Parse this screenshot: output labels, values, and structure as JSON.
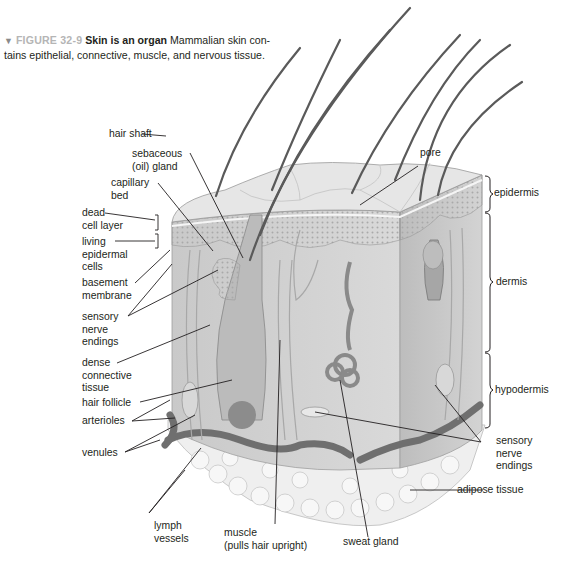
{
  "caption": {
    "figure_number": "FIGURE 32-9",
    "title": "Skin is an organ",
    "body_line1": "Mammalian skin con-",
    "body_line2": "tains epithelial, connective, muscle, and nervous tissue."
  },
  "labels_left": {
    "hair_shaft": "hair shaft",
    "sebaceous_1": "sebaceous",
    "sebaceous_2": "(oil) gland",
    "capillary_1": "capillary",
    "capillary_2": "bed",
    "dead_1": "dead",
    "dead_2": "cell layer",
    "living_1": "living",
    "living_2": "epidermal",
    "living_3": "cells",
    "basement_1": "basement",
    "basement_2": "membrane",
    "sensory_1": "sensory",
    "sensory_2": "nerve",
    "sensory_3": "endings",
    "dense_1": "dense",
    "dense_2": "connective",
    "dense_3": "tissue",
    "hair_follicle": "hair follicle",
    "arterioles": "arterioles",
    "venules": "venules"
  },
  "labels_bottom": {
    "lymph_1": "lymph",
    "lymph_2": "vessels",
    "muscle_1": "muscle",
    "muscle_2": "(pulls hair upright)",
    "sweat_gland": "sweat gland"
  },
  "labels_right": {
    "pore": "pore",
    "epidermis": "epidermis",
    "dermis": "dermis",
    "hypodermis": "hypodermis",
    "sensory_1": "sensory",
    "sensory_2": "nerve",
    "sensory_3": "endings",
    "adipose": "adipose tissue"
  },
  "colors": {
    "figure_label": "#b5b5b5",
    "text": "#231f20",
    "leader_line": "#231f20",
    "skin_surface": "#e4e4e4",
    "dermis": "#cfcfcf",
    "vessel": "#6f6f6f",
    "adipose": "#f1f1f1"
  }
}
